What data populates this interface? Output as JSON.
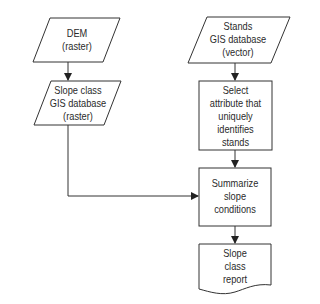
{
  "nodes": {
    "dem": {
      "lines": [
        "DEM",
        "(raster)"
      ],
      "shape": "parallelogram"
    },
    "slope_class_db": {
      "lines": [
        "Slope class",
        "GIS database",
        "(raster)"
      ],
      "shape": "parallelogram"
    },
    "stands_db": {
      "lines": [
        "Stands",
        "GIS database",
        "(vector)"
      ],
      "shape": "parallelogram"
    },
    "select_attribute": {
      "lines": [
        "Select",
        "attribute that",
        "uniquely",
        "identifies",
        "stands"
      ],
      "shape": "rectangle"
    },
    "summarize": {
      "lines": [
        "Summarize",
        "slope",
        "conditions"
      ],
      "shape": "rectangle"
    },
    "report": {
      "lines": [
        "Slope",
        "class",
        "report"
      ],
      "shape": "document"
    }
  },
  "edges": [
    {
      "from": "dem",
      "to": "slope_class_db"
    },
    {
      "from": "stands_db",
      "to": "select_attribute"
    },
    {
      "from": "select_attribute",
      "to": "summarize"
    },
    {
      "from": "slope_class_db",
      "to": "summarize"
    },
    {
      "from": "summarize",
      "to": "report"
    }
  ],
  "colors": {
    "stroke": "#333333",
    "background": "#ffffff"
  }
}
